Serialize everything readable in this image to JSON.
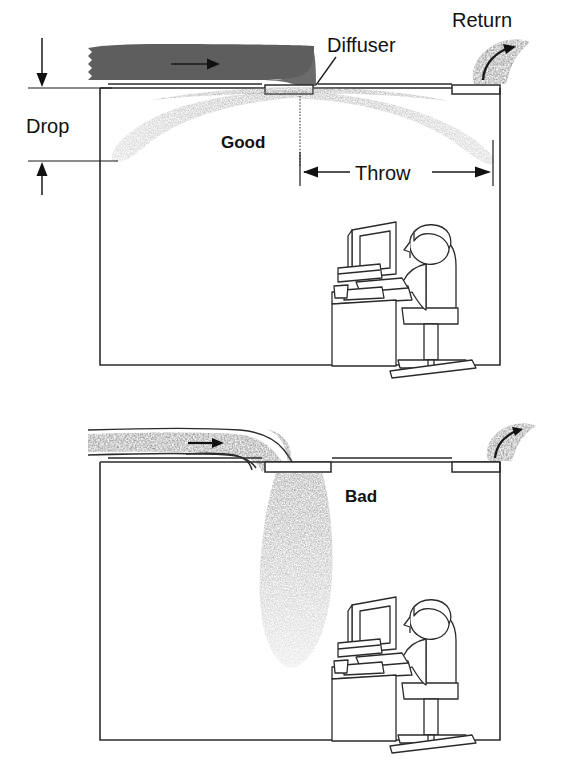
{
  "figure": {
    "panels": [
      {
        "id": "good",
        "verdict_label": "Good",
        "description": "Ceiling diffuser discharges horizontally; jet hugs ceiling and spreads across the room",
        "labels": {
          "diffuser": "Diffuser",
          "return": "Return",
          "drop": "Drop",
          "throw": "Throw"
        }
      },
      {
        "id": "bad",
        "verdict_label": "Bad",
        "description": "Duct elbows sharply down; air dumps vertically onto the occupant",
        "labels": {}
      }
    ]
  },
  "colors": {
    "line": "#2b2b2b",
    "duct_dark": "#5e5e5e",
    "jet_light": "#b9b9b9",
    "jet_mid": "#9a9a9a",
    "paper": "#ffffff",
    "text": "#111111"
  },
  "icons": {
    "flow_arrow": "flow-arrow-icon",
    "return_arrow": "return-arrow-icon",
    "drop_arrow_down": "arrow-down-icon",
    "drop_arrow_up": "arrow-up-icon",
    "throw_arrow_left": "arrow-left-icon",
    "throw_arrow_right": "arrow-right-icon"
  },
  "workstation": {
    "items": [
      "monitor",
      "keyboard",
      "desk",
      "office-chair",
      "seated-person",
      "cup",
      "papers"
    ]
  }
}
